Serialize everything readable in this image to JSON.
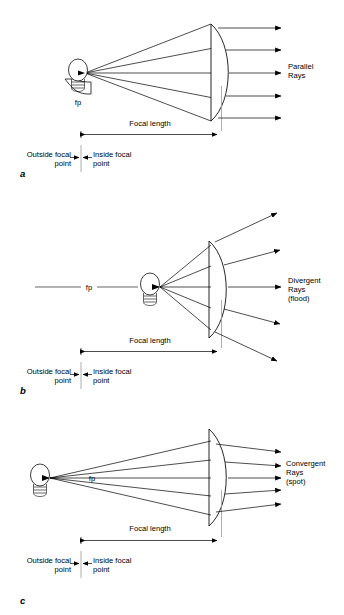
{
  "figure": {
    "background_color": "#ffffff",
    "ink_color": "#000000",
    "guide_color": "#9a9a9a",
    "panels": [
      {
        "letter": "a",
        "ray_label_lines": [
          "Parallel",
          "Rays"
        ],
        "source_label": "fp",
        "focal_length_label": "Focal length",
        "outside_label_lines": [
          "Outside focal",
          "point"
        ],
        "inside_label_lines": [
          "Inside focal",
          "point"
        ],
        "bulb_position": "at-focal-point",
        "ray_behavior": "parallel",
        "ray_count": 5
      },
      {
        "letter": "b",
        "ray_label_lines": [
          "Divergent",
          "Rays",
          "(flood)"
        ],
        "source_label": "fp",
        "focal_length_label": "Focal length",
        "outside_label_lines": [
          "Outside focal",
          "point"
        ],
        "inside_label_lines": [
          "Inside focal",
          "point"
        ],
        "bulb_position": "inside-focal-point",
        "ray_behavior": "divergent",
        "ray_count": 5
      },
      {
        "letter": "c",
        "ray_label_lines": [
          "Convergent",
          "Rays",
          "(spot)"
        ],
        "source_label": "fp",
        "focal_length_label": "Focal length",
        "outside_label_lines": [
          "Outside focal",
          "point"
        ],
        "inside_label_lines": [
          "Inside focal",
          "point"
        ],
        "bulb_position": "outside-focal-point",
        "ray_behavior": "convergent",
        "ray_count": 5
      }
    ]
  }
}
